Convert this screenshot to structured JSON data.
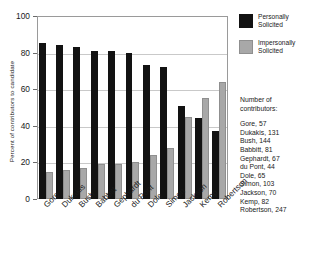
{
  "chart_data": {
    "type": "bar",
    "title": "",
    "xlabel": "",
    "ylabel": "Percent of contributors to candidate",
    "ylim": [
      0,
      100
    ],
    "yticks": [
      0,
      20,
      40,
      60,
      80,
      100
    ],
    "grid": true,
    "legend_position": "top-right",
    "categories": [
      "Gore",
      "Dukakis",
      "Bush",
      "Babbitt",
      "Gephardt",
      "du Pont",
      "Dole",
      "Simon",
      "Jackson",
      "Kemp",
      "Robertson"
    ],
    "series": [
      {
        "name": "Personally Solicited",
        "color": "#121212",
        "values": [
          85,
          84,
          83,
          81,
          81,
          80,
          73,
          72,
          51,
          44,
          37
        ]
      },
      {
        "name": "Impersonally Solicited",
        "color": "#a8a8a8",
        "values": [
          15,
          16,
          17,
          19,
          19,
          20,
          24,
          28,
          45,
          55,
          64
        ]
      }
    ],
    "annotations": {
      "note_title": "Number of contributors:",
      "contributors": [
        {
          "name": "Gore",
          "count": 57
        },
        {
          "name": "Dukakis",
          "count": 131
        },
        {
          "name": "Bush",
          "count": 144
        },
        {
          "name": "Babbitt",
          "count": 81
        },
        {
          "name": "Gephardt",
          "count": 67
        },
        {
          "name": "du Pont",
          "count": 44
        },
        {
          "name": "Dole",
          "count": 65
        },
        {
          "name": "Simon",
          "count": 103
        },
        {
          "name": "Jackson",
          "count": 70
        },
        {
          "name": "Kemp",
          "count": 82
        },
        {
          "name": "Robertson",
          "count": 247
        }
      ]
    }
  },
  "legend": {
    "items": [
      {
        "label_line1": "Personally",
        "label_line2": "Solicited"
      },
      {
        "label_line1": "Impersonally",
        "label_line2": "Solicited"
      }
    ]
  },
  "note": {
    "title_line1": "Number of",
    "title_line2": "contributors:",
    "lines": [
      "Gore, 57",
      "Dukakis, 131",
      "Bush, 144",
      "Babbitt, 81",
      "Gephardt, 67",
      "du Pont, 44",
      "Dole, 65",
      "Simon, 103",
      "Jackson, 70",
      "Kemp, 82",
      "Robertson, 247"
    ]
  }
}
